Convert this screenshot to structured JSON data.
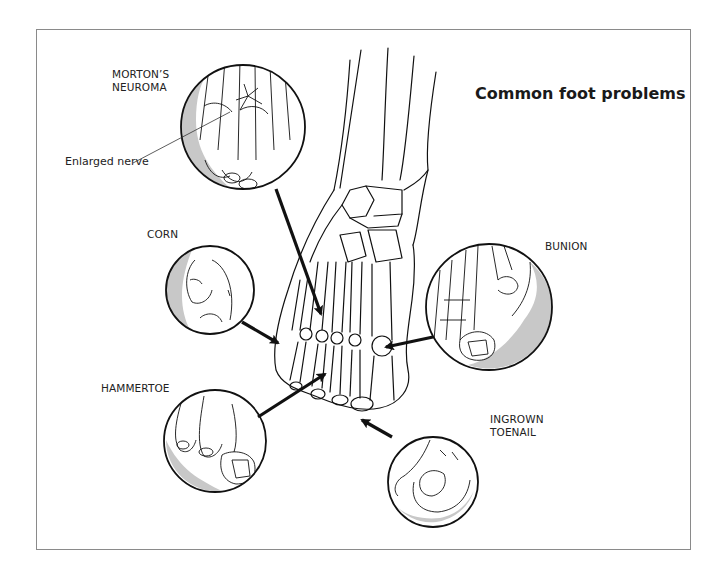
{
  "title": "Common foot problems",
  "labels": {
    "mortons_neuroma": "MORTON’S\nNEUROMA",
    "enlarged_nerve": "Enlarged nerve",
    "corn": "CORN",
    "hammertoe": "HAMMERTOE",
    "bunion": "BUNION",
    "ingrown_toenail": "INGROWN\nTOENAIL"
  },
  "insets": [
    {
      "id": "mortons-neuroma",
      "cx": 243,
      "cy": 127,
      "r": 62,
      "target": [
        323,
        318
      ]
    },
    {
      "id": "corn",
      "cx": 210,
      "cy": 290,
      "r": 44,
      "target": [
        280,
        345
      ]
    },
    {
      "id": "hammertoe",
      "cx": 215,
      "cy": 441,
      "r": 51,
      "target": [
        327,
        372
      ]
    },
    {
      "id": "bunion",
      "cx": 489,
      "cy": 307,
      "r": 63,
      "target": [
        382,
        348
      ]
    },
    {
      "id": "ingrown-toenail",
      "cx": 433,
      "cy": 482,
      "r": 45,
      "target": [
        360,
        420
      ]
    }
  ],
  "colors": {
    "frame": "#8a8a8a",
    "ink": "#111111",
    "shade": "#c8c8c8"
  }
}
